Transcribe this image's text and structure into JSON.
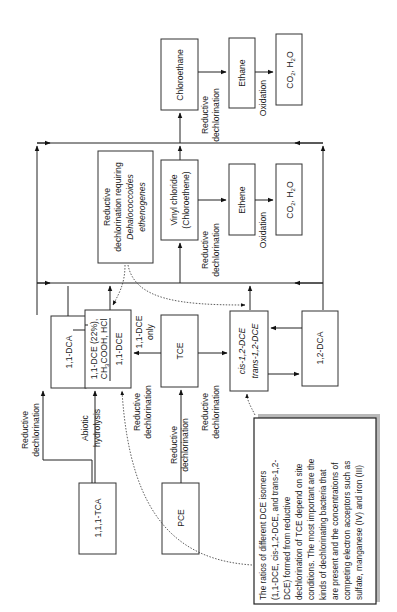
{
  "diagram": {
    "orientation": "rotated-90-ccw",
    "nodes": {
      "tca111": "1,1,1-TCA",
      "dca11": "1,1-DCA",
      "dce11_products": {
        "line1": "1,1-DCE (22%),",
        "line2": "CH3COOH, HCl",
        "line2_parts": [
          "CH",
          "3",
          "COOH, HCl"
        ],
        "line3": "1,1-DCE"
      },
      "pce": "PCE",
      "tce": "TCE",
      "dce12": {
        "line1": "cis-1,2-DCE",
        "line2": "trans-1,2-DCE"
      },
      "dca12": "1,2-DCA",
      "dehalococcoides": {
        "line1": "Reductive",
        "line2": "dechlorination requiring",
        "line3": "Dehalococcoides",
        "line4": "ethenogenes"
      },
      "vinyl_chloride": {
        "line1": "Vinyl chloride",
        "line2": "(Chloroethene)"
      },
      "ethene": "Ethene",
      "co2_h2o_a": {
        "main": "CO",
        "sub1": "2",
        "mid": ", H",
        "sub2": "2",
        "end": "O"
      },
      "chloroethane": "Chloroethane",
      "ethane": "Ethane",
      "co2_h2o_b": {
        "main": "CO",
        "sub1": "2",
        "mid": ", H",
        "sub2": "2",
        "end": "O"
      }
    },
    "edge_labels": {
      "reductive": "Reductive",
      "dechlorination": "dechlorination",
      "abiotic": "Abiotic",
      "hydrolysis": "hydrolysis",
      "dce11_only_1": "1,1-DCE",
      "dce11_only_2": "only",
      "oxidation": "Oxidation"
    },
    "note": {
      "lines": [
        "The ratios of different DCE isomers",
        "(1,1-DCE, cis-1,2-DCE, and trans-1,2-",
        "DCE) formed from reductive",
        "dechlorination of TCE depend on site",
        "conditions. The most important are the",
        "kinds of dechlorinating bacteria that",
        "are present and the concentrations of",
        "competing electron acceptors such as",
        "sulfate, manganese (IV) and iron (III)"
      ]
    }
  }
}
